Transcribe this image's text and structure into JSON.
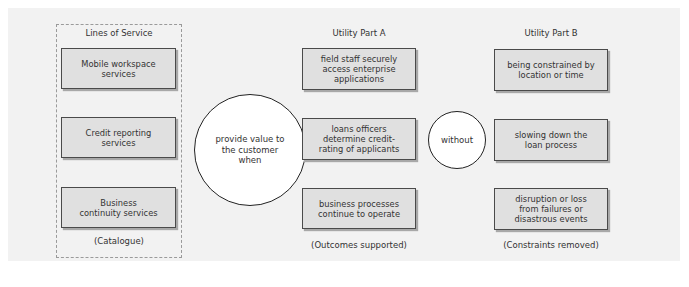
{
  "diagram": {
    "columns": {
      "lines_of_service": {
        "heading": "Lines of Service",
        "items": [
          "Mobile workspace\nservices",
          "Credit reporting\nservices",
          "Business\ncontinuity services"
        ],
        "caption": "(Catalogue)"
      },
      "utility_part_a": {
        "heading": "Utility Part A",
        "items": [
          "field staff securely\naccess enterprise\napplications",
          "loans officers\ndetermine credit-\nrating of applicants",
          "business processes\ncontinue to operate"
        ],
        "caption": "(Outcomes supported)"
      },
      "utility_part_b": {
        "heading": "Utility Part B",
        "items": [
          "being constrained by\nlocation or time",
          "slowing down the\nloan process",
          "disruption or loss\nfrom failures or\ndisastrous events"
        ],
        "caption": "(Constraints removed)"
      }
    },
    "connectors": {
      "value_circle": "provide value to\nthe customer\nwhen",
      "without_circle": "without"
    },
    "colors": {
      "panel_background": "#f2f2f2",
      "box_fill": "#e0e0e0",
      "box_border": "#4a4a4a",
      "circle_fill": "#ffffff",
      "dashed_border": "#9a9a9a"
    }
  }
}
